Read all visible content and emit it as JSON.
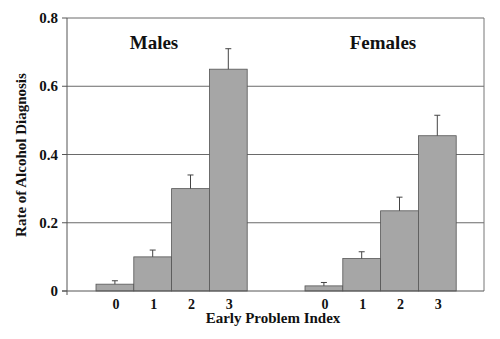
{
  "chart_data": {
    "type": "bar",
    "title": "",
    "xlabel": "Early Problem Index",
    "ylabel": "Rate of Alcohol Diagnosis",
    "ylim": [
      0,
      0.8
    ],
    "yticks": [
      0,
      0.2,
      0.4,
      0.6,
      0.8
    ],
    "ytick_labels": [
      "0",
      "0.2",
      "0.4",
      "0.6",
      "0.8"
    ],
    "grid": true,
    "categories": [
      "0",
      "1",
      "2",
      "3"
    ],
    "groups": [
      {
        "name": "Males",
        "values": [
          0.02,
          0.1,
          0.3,
          0.65
        ],
        "error_upper": [
          0.03,
          0.12,
          0.34,
          0.71
        ]
      },
      {
        "name": "Females",
        "values": [
          0.015,
          0.095,
          0.235,
          0.455
        ],
        "error_upper": [
          0.025,
          0.115,
          0.275,
          0.515
        ]
      }
    ],
    "bar_color": "#a6a6a6",
    "legend": "none"
  }
}
